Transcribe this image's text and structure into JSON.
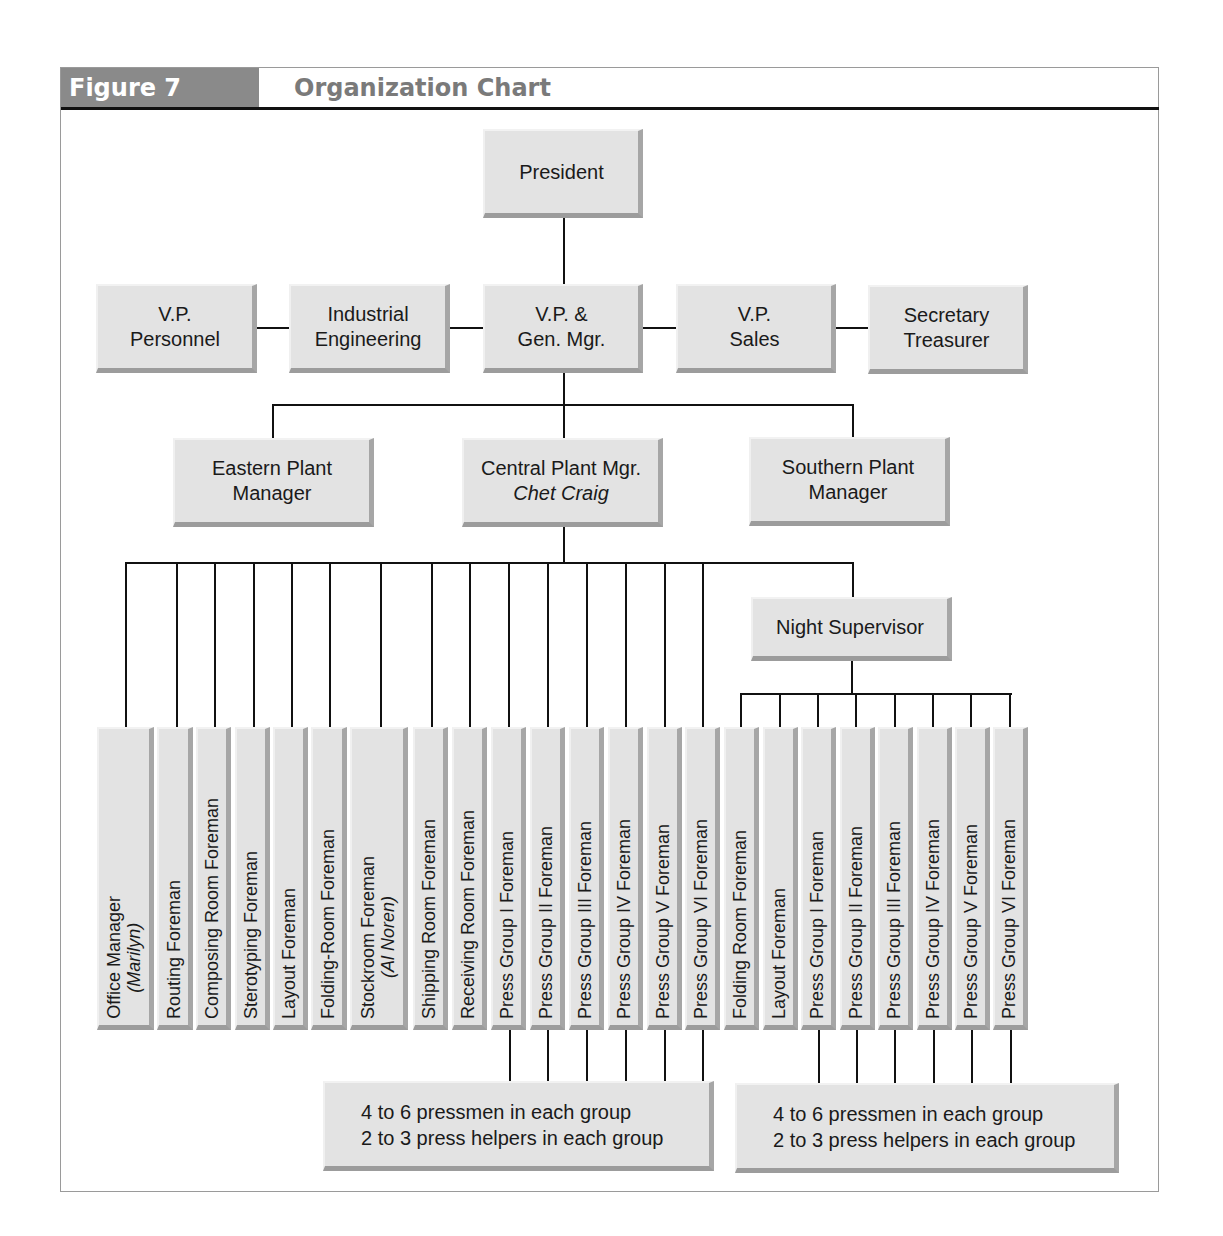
{
  "figure": {
    "tag": "Figure 7",
    "title": "Organization Chart"
  },
  "colors": {
    "box_fill": "#e3e3e3",
    "box_shadow": "#a6a6a6",
    "tag_bg": "#8a8a8a",
    "title_text": "#7a7a7a",
    "line": "#111111"
  },
  "top": {
    "president": "President"
  },
  "executives": [
    {
      "line1": "V.P.",
      "line2": "Personnel"
    },
    {
      "line1": "Industrial",
      "line2": "Engineering"
    },
    {
      "line1": "V.P. &",
      "line2": "Gen. Mgr."
    },
    {
      "line1": "V.P.",
      "line2": "Sales"
    },
    {
      "line1": "Secretary",
      "line2": "Treasurer"
    }
  ],
  "plants": [
    {
      "line1": "Eastern Plant",
      "line2": "Manager"
    },
    {
      "line1": "Central Plant Mgr.",
      "line2": "Chet Craig"
    },
    {
      "line1": "Southern Plant",
      "line2": "Manager"
    }
  ],
  "night_supervisor": "Night Supervisor",
  "day_foremen": [
    {
      "label": "Office Manager",
      "sub": "(Marilyn)"
    },
    {
      "label": "Routing Foreman"
    },
    {
      "label": "Composing Room Foreman"
    },
    {
      "label": "Sterotyping Foreman"
    },
    {
      "label": "Layout Foreman"
    },
    {
      "label": "Folding-Room Foreman"
    },
    {
      "label": "Stockroom Foreman",
      "sub": "(Al Noren)"
    },
    {
      "label": "Shipping Room Foreman"
    },
    {
      "label": "Receiving Room Foreman"
    },
    {
      "label": "Press Group I Foreman"
    },
    {
      "label": "Press Group II Foreman"
    },
    {
      "label": "Press Group III Foreman"
    },
    {
      "label": "Press Group IV Foreman"
    },
    {
      "label": "Press Group V Foreman"
    },
    {
      "label": "Press Group VI Foreman"
    }
  ],
  "night_foremen": [
    {
      "label": "Folding Room Foreman"
    },
    {
      "label": "Layout Foreman"
    },
    {
      "label": "Press Group I Foreman"
    },
    {
      "label": "Press Group II Foreman"
    },
    {
      "label": "Press Group III Foreman"
    },
    {
      "label": "Press Group IV Foreman"
    },
    {
      "label": "Press Group V Foreman"
    },
    {
      "label": "Press Group VI Foreman"
    }
  ],
  "notes": [
    {
      "line1": "4 to 6 pressmen in each group",
      "line2": "2 to 3 press helpers in each group"
    },
    {
      "line1": "4 to 6 pressmen in each group",
      "line2": "2 to 3 press helpers in each group"
    }
  ]
}
